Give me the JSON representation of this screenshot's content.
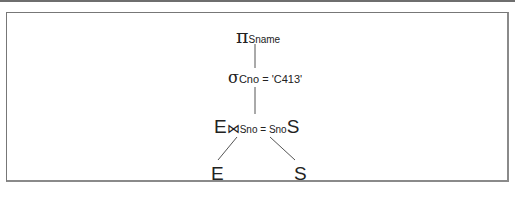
{
  "diagram": {
    "type": "relational-algebra-query-tree",
    "nodes": {
      "projection": {
        "symbol": "π",
        "subscript": "Sname"
      },
      "selection": {
        "symbol": "σ",
        "subscript": "Cno = 'C413'"
      },
      "join": {
        "left": "E",
        "symbol": "⋈",
        "subscript": "Sno = Sno",
        "right": "S"
      },
      "leaf_left": {
        "label": "E"
      },
      "leaf_right": {
        "label": "S"
      }
    },
    "edges": [
      [
        "projection",
        "selection"
      ],
      [
        "selection",
        "join"
      ],
      [
        "join",
        "leaf_left"
      ],
      [
        "join",
        "leaf_right"
      ]
    ]
  }
}
